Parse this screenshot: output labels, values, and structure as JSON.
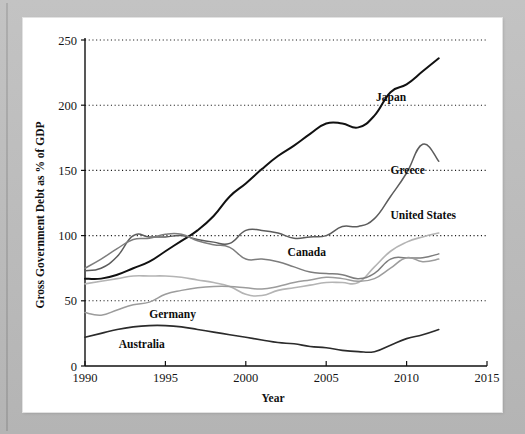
{
  "figure": {
    "background_color": "#bdbdbd",
    "panel_color": "#ffffff"
  },
  "chart_data": {
    "type": "line",
    "title": "",
    "xlabel": "Year",
    "ylabel": "Gross Government Debt as % of GDP",
    "xlim": [
      1990,
      2015
    ],
    "ylim": [
      0,
      250
    ],
    "xticks": [
      1990,
      1995,
      2000,
      2005,
      2010,
      2015
    ],
    "xtick_labels": [
      "1990",
      "1995",
      "2000",
      "2005",
      "2010",
      "2015"
    ],
    "yticks": [
      0,
      50,
      100,
      150,
      200,
      250
    ],
    "ytick_labels": [
      "0",
      "50",
      "100",
      "150",
      "200",
      "250"
    ],
    "grid": "horizontal-dotted",
    "legend": "inline-labels",
    "x": [
      1990,
      1991,
      1992,
      1993,
      1994,
      1995,
      1996,
      1997,
      1998,
      1999,
      2000,
      2001,
      2002,
      2003,
      2004,
      2005,
      2006,
      2007,
      2008,
      2009,
      2010,
      2011,
      2012
    ],
    "series": [
      {
        "name": "Japan",
        "color": "#111111",
        "width": 2.0,
        "label_x": 2008.1,
        "label_y": 203,
        "values": [
          67,
          67,
          70,
          75,
          80,
          88,
          96,
          104,
          115,
          130,
          140,
          151,
          161,
          169,
          178,
          186,
          186,
          183,
          192,
          210,
          216,
          226,
          236
        ]
      },
      {
        "name": "Greece",
        "color": "#5c5c5c",
        "width": 1.5,
        "label_x": 2009.0,
        "label_y": 147,
        "values": [
          73,
          75,
          84,
          100,
          99,
          99,
          100,
          97,
          95,
          94,
          104,
          104,
          102,
          98,
          99,
          100,
          107,
          107,
          113,
          130,
          148,
          170,
          157
        ]
      },
      {
        "name": "United States",
        "color": "#b4b4b4",
        "width": 1.6,
        "label_x": 2009.0,
        "label_y": 113,
        "values": [
          63,
          65,
          67,
          69,
          69,
          69,
          68,
          66,
          64,
          61,
          55,
          54,
          58,
          60,
          62,
          64,
          64,
          64,
          76,
          88,
          95,
          99,
          102
        ]
      },
      {
        "name": "Canada",
        "color": "#7d7d7d",
        "width": 1.5,
        "label_x": 2002.6,
        "label_y": 84,
        "values": [
          75,
          82,
          90,
          97,
          98,
          101,
          101,
          96,
          93,
          91,
          82,
          82,
          80,
          76,
          72,
          71,
          70,
          67,
          71,
          82,
          83,
          83,
          86
        ]
      },
      {
        "name": "Germany",
        "color": "#9c9c9c",
        "width": 1.5,
        "label_x": 1994.0,
        "label_y": 37,
        "values": [
          41,
          39,
          43,
          47,
          49,
          55,
          58,
          60,
          61,
          61,
          60,
          59,
          61,
          64,
          66,
          68,
          67,
          65,
          67,
          75,
          83,
          80,
          82
        ]
      },
      {
        "name": "Australia",
        "color": "#2b2b2b",
        "width": 1.6,
        "label_x": 1992.1,
        "label_y": 14,
        "values": [
          22,
          25,
          28,
          30,
          31,
          31,
          30,
          28,
          26,
          24,
          22,
          20,
          18,
          17,
          15,
          14,
          12,
          11,
          11,
          16,
          21,
          24,
          28
        ]
      }
    ]
  }
}
